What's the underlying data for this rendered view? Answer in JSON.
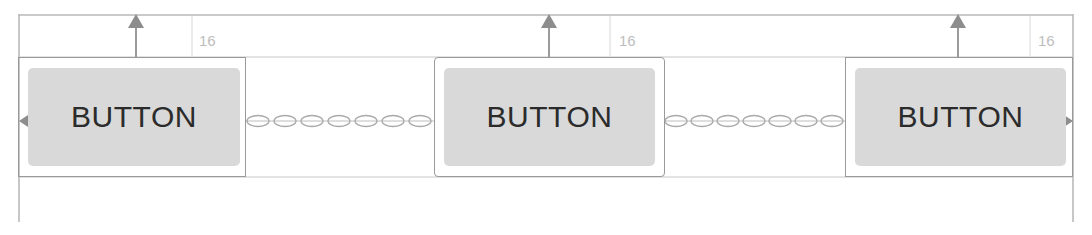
{
  "canvas": {
    "width": 1092,
    "height": 235,
    "background": "#ffffff",
    "title": "Constraint layout chain preview"
  },
  "colors": {
    "guide_line": "#b9b9b9",
    "box_stroke": "#9a9a9a",
    "button_fill": "#d9d9d9",
    "button_text": "#2b2b2b",
    "margin_text": "#bdbdbd",
    "arrow_fill": "#8d8d8d",
    "chain_stroke": "#a9a9a9"
  },
  "widgets": [
    {
      "id": "button-1",
      "label": "BUTTON",
      "container": {
        "x": 18,
        "y": 57,
        "w": 228,
        "h": 120,
        "rounded": false
      },
      "face": {
        "x": 28,
        "y": 68,
        "w": 212,
        "h": 98
      },
      "top_margin": {
        "value": "16",
        "label_x": 199,
        "label_y": 33,
        "arrow_x": 136
      }
    },
    {
      "id": "button-2",
      "label": "BUTTON",
      "container": {
        "x": 434,
        "y": 57,
        "w": 231,
        "h": 120,
        "rounded": true
      },
      "face": {
        "x": 444,
        "y": 68,
        "w": 211,
        "h": 98
      },
      "top_margin": {
        "value": "16",
        "label_x": 619,
        "label_y": 33,
        "arrow_x": 549
      }
    },
    {
      "id": "button-3",
      "label": "BUTTON",
      "container": {
        "x": 845,
        "y": 57,
        "w": 228,
        "h": 120,
        "rounded": false
      },
      "face": {
        "x": 855,
        "y": 68,
        "w": 211,
        "h": 98
      },
      "top_margin": {
        "value": "16",
        "label_x": 1038,
        "label_y": 33,
        "arrow_x": 958
      }
    }
  ],
  "guides": {
    "top_rail_y": 15,
    "left_rail_x": 19,
    "right_rail_x": 1073,
    "rail_top_y": 14,
    "rail_bottom_y": 222,
    "inner_band_y": 57,
    "inner_band_bottom_y": 177
  },
  "chains": [
    {
      "id": "chain-1-2",
      "x1": 246,
      "x2": 434,
      "y": 121,
      "links": 7
    },
    {
      "id": "chain-2-3",
      "x1": 665,
      "x2": 845,
      "y": 121,
      "links": 7
    }
  ],
  "edge_anchors": [
    {
      "id": "left-anchor-arrow",
      "direction": "left",
      "x": 19,
      "y": 121
    },
    {
      "id": "right-anchor-arrow",
      "direction": "right",
      "x": 1073,
      "y": 121
    }
  ],
  "tick_marks": [
    {
      "id": "tick-1",
      "x": 192,
      "y1": 15,
      "y2": 57
    },
    {
      "id": "tick-2",
      "x": 610,
      "y1": 15,
      "y2": 57
    },
    {
      "id": "tick-3",
      "x": 1030,
      "y1": 15,
      "y2": 57
    }
  ]
}
